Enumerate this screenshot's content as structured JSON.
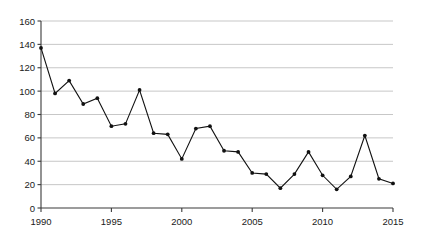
{
  "chart_data": {
    "type": "line",
    "title": "",
    "subtitle": "",
    "xlabel": "",
    "ylabel": "",
    "x": [
      1990,
      1991,
      1992,
      1993,
      1994,
      1995,
      1996,
      1997,
      1998,
      1999,
      2000,
      2001,
      2002,
      2003,
      2004,
      2005,
      2006,
      2007,
      2008,
      2009,
      2010,
      2011,
      2012,
      2013,
      2014,
      2015
    ],
    "values": [
      137,
      98,
      109,
      89,
      94,
      70,
      72,
      101,
      64,
      63,
      42,
      68,
      70,
      49,
      48,
      30,
      29,
      17,
      29,
      48,
      28,
      16,
      27,
      62,
      25,
      21
    ],
    "series": [
      {
        "name": "series-1",
        "values": [
          137,
          98,
          109,
          89,
          94,
          70,
          72,
          101,
          64,
          63,
          42,
          68,
          70,
          49,
          48,
          30,
          29,
          17,
          29,
          48,
          28,
          16,
          27,
          62,
          25,
          21
        ]
      }
    ],
    "xlim": [
      1990,
      2015
    ],
    "ylim": [
      0,
      160
    ],
    "y_ticks": [
      0,
      20,
      40,
      60,
      80,
      100,
      120,
      140,
      160
    ],
    "y_tick_labels": [
      "0",
      "20",
      "40",
      "60",
      "80",
      "100",
      "120",
      "140",
      "160"
    ],
    "x_ticks": [
      1990,
      1995,
      2000,
      2005,
      2010,
      2015
    ],
    "x_tick_labels": [
      "1990",
      "1995",
      "2000",
      "2005",
      "2010",
      "2015"
    ],
    "grid": true,
    "grid_axis": "y",
    "legend": false,
    "legend_position": "none",
    "marker": "filled-circle",
    "line_color": "#111111",
    "marker_color": "#111111",
    "grid_color": "#b9b9b9",
    "axis_color": "#3a3a3a",
    "background_color": "#ffffff",
    "annotations": []
  }
}
